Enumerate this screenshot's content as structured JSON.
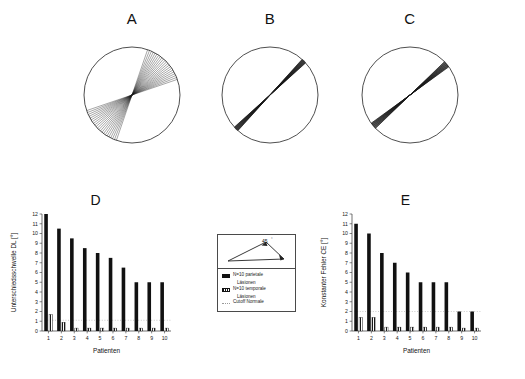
{
  "figure": {
    "panel_letters": {
      "a": "A",
      "b": "B",
      "c": "C",
      "d": "D",
      "e": "E"
    }
  },
  "polar_panels": [
    {
      "key": "a",
      "letter": "A",
      "description": "wide fan of response lines, large angular scatter",
      "mean_angle_deg": 45,
      "spread_deg": 26,
      "line_count": 22
    },
    {
      "key": "b",
      "letter": "B",
      "description": "tightly clustered response lines near 45 degrees",
      "mean_angle_deg": 45,
      "spread_deg": 3,
      "line_count": 14
    },
    {
      "key": "c",
      "letter": "C",
      "description": "tightly clustered response lines, slight offset",
      "mean_angle_deg": 40,
      "spread_deg": 4,
      "line_count": 14
    }
  ],
  "legend": {
    "angle_label": "45",
    "angle_unit": "°",
    "items": [
      {
        "swatch": "solid",
        "label": "N=10 parietale",
        "sublabel": "Läsionen"
      },
      {
        "swatch": "hatched",
        "label": "N=10 temporale",
        "sublabel": "Läsionen"
      },
      {
        "swatch": "dotted",
        "label": "Cutoff Normale",
        "sublabel": ""
      }
    ]
  },
  "chart_data": [
    {
      "type": "bar",
      "key": "d",
      "title": "D",
      "xlabel": "Patienten",
      "ylabel": "Unterschiedsschwelle  DL  [°]",
      "categories": [
        "1",
        "2",
        "3",
        "4",
        "5",
        "6",
        "7",
        "8",
        "9",
        "10"
      ],
      "ylim": [
        0,
        12
      ],
      "yticks": [
        0,
        1,
        2,
        3,
        4,
        5,
        6,
        7,
        8,
        9,
        10,
        11,
        12
      ],
      "grid": false,
      "legend_position": "center-external",
      "cutoff": {
        "label": "Cutoff Normale",
        "value": 1.1,
        "style": "dotted",
        "color": "#b4b4b4"
      },
      "series": [
        {
          "name": "N=10 parietale Läsionen",
          "style": "solid",
          "color": "#111111",
          "values": [
            12,
            10.5,
            9.5,
            8.5,
            8,
            7.5,
            6.5,
            5,
            5,
            5
          ]
        },
        {
          "name": "N=10 temporale Läsionen",
          "style": "hatched",
          "color": "#333333",
          "values": [
            1.7,
            0.9,
            0.3,
            0.3,
            0.3,
            0.3,
            0.3,
            0.3,
            0.3,
            0.3
          ]
        }
      ]
    },
    {
      "type": "bar",
      "key": "e",
      "title": "E",
      "xlabel": "Patienten",
      "ylabel": "Konstanter Fehler  CE  [°]",
      "categories": [
        "1",
        "2",
        "3",
        "4",
        "5",
        "6",
        "7",
        "8",
        "9",
        "10"
      ],
      "ylim": [
        0,
        12
      ],
      "yticks": [
        0,
        1,
        2,
        3,
        4,
        5,
        6,
        7,
        8,
        9,
        10,
        11,
        12
      ],
      "grid": false,
      "legend_position": "center-external",
      "cutoff": {
        "label": "Cutoff Normale",
        "value": 2,
        "style": "dotted",
        "color": "#b4b4b4"
      },
      "series": [
        {
          "name": "N=10 parietale Läsionen",
          "style": "solid",
          "color": "#111111",
          "values": [
            11,
            10,
            8,
            7,
            6,
            5,
            5,
            5,
            2,
            2
          ]
        },
        {
          "name": "N=10 temporale Läsionen",
          "style": "hatched",
          "color": "#333333",
          "values": [
            1.4,
            1.4,
            0.4,
            0.4,
            0.4,
            0.4,
            0.4,
            0.4,
            0.3,
            0.3
          ]
        }
      ]
    }
  ]
}
